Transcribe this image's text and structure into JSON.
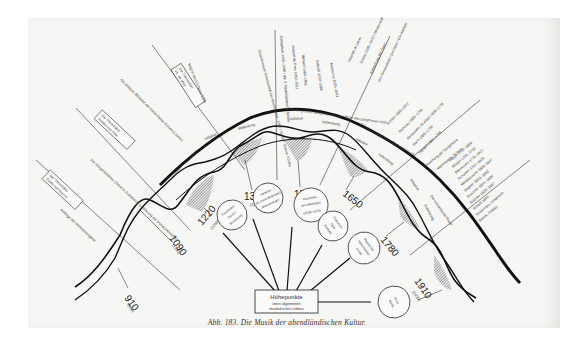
{
  "figure": {
    "caption": "Abb. 183. Die Musik der abendländischen Kultur.",
    "center_box": {
      "title": "Höhepunkte",
      "line1": "eines allgemeinen",
      "line2": "musikalischen Lebens"
    },
    "phase_labels": {
      "initiative": "Initiative",
      "vollendung": "Vollendung"
    },
    "peaks": [
      {
        "year": "910",
        "sub": "(900)"
      },
      {
        "year": "1090",
        "sub": "(1100)"
      },
      {
        "year": "1220",
        "sub": "(1260)"
      },
      {
        "year": "1370",
        "sub": "(1430)"
      },
      {
        "year": "1530",
        "sub": ""
      },
      {
        "year": "1650",
        "sub": ""
      },
      {
        "year": "1780",
        "sub": ""
      },
      {
        "year": "1910",
        "sub": "(1930)"
      }
    ],
    "circles": [
      {
        "l1": "Troubadour",
        "l2": "Pérotin",
        "l3": "Minnesang"
      },
      {
        "l1": "Vorbeter",
        "l2": "ars nova (Machaut)",
        "l3": "Meistersinger"
      },
      {
        "l1": "Hochblüte",
        "l2": "des Madrigals",
        "l3": "(1530–1570)"
      },
      {
        "l1": "Oratorium",
        "l2": "Oper",
        "l3": "Kantate"
      },
      {
        "l1": "Klassische",
        "l2": "Instrumental-",
        "l3": "musik"
      },
      {
        "l1": "Neue",
        "l2": "Musik",
        "l3": ""
      }
    ],
    "boxes": [
      {
        "l1": "Die Theoretiker",
        "l2": "Guido von Arezzo"
      },
      {
        "l1": "Die Theoretiker",
        "l2": "Franko von Köln"
      },
      {
        "l1": "Die Theoretiker",
        "l2": "Ph. de Vitry"
      }
    ],
    "annotations": [
      "Anfänge der Mehrstimmigkeit",
      "Der Gregorianische Choral in Frankreich: Einführung der Mensuralnotation",
      "Ars antiqua: Blütezeit der Notre-Dame-Schule (Leonin)",
      "Beginn der Ars Nova 1320",
      "Geschlossene Gesellschaft der Niederländer: 1400 / Niederl. Schule / Dufay",
      "Ockeghem 1430–1495 / die 3. Niederländische Schule",
      "Josquin de Pres 1450–1521",
      "Willaert 1480–1562",
      "Gabrieli 1510–1586",
      "Palestrina 1525–1594",
      "Zeit der großen römischen Schule / Blüte des polyphonen Stils",
      "Orlando di Lasso",
      "Schütz 1585–1672 / Monteverdi",
      "Entstehung der Oper",
      "Der Generalbaß / Die Oper / Die Kantate",
      "Zeit der musikalischen Orchestermusik",
      "Schütz 1585–1672",
      "Rameau 1683–1764",
      "Alessandro Scarlatti 1659–1725",
      "Bach 1685–1750",
      "Händel 1685–1759",
      "Entstehung der Symphonie",
      "Mannheimer Schule",
      "Haydn 1732–1809",
      "Mozart 1756–1791",
      "Beethoven 1770–1827",
      "Schubert 1797–1828",
      "Mendelssohn 1809–1847",
      "Die romantische Musik",
      "Wagner 1813–1883",
      "Bruckner 1824–1896",
      "Brahms 1833–1897",
      "Strauß 1864–",
      "Strawinsky, Hindemith",
      "Bartók, Kodály"
    ],
    "colors": {
      "ink": "#1a1a1a",
      "paper": "#f6f6f4",
      "hatch": "#555555"
    }
  }
}
